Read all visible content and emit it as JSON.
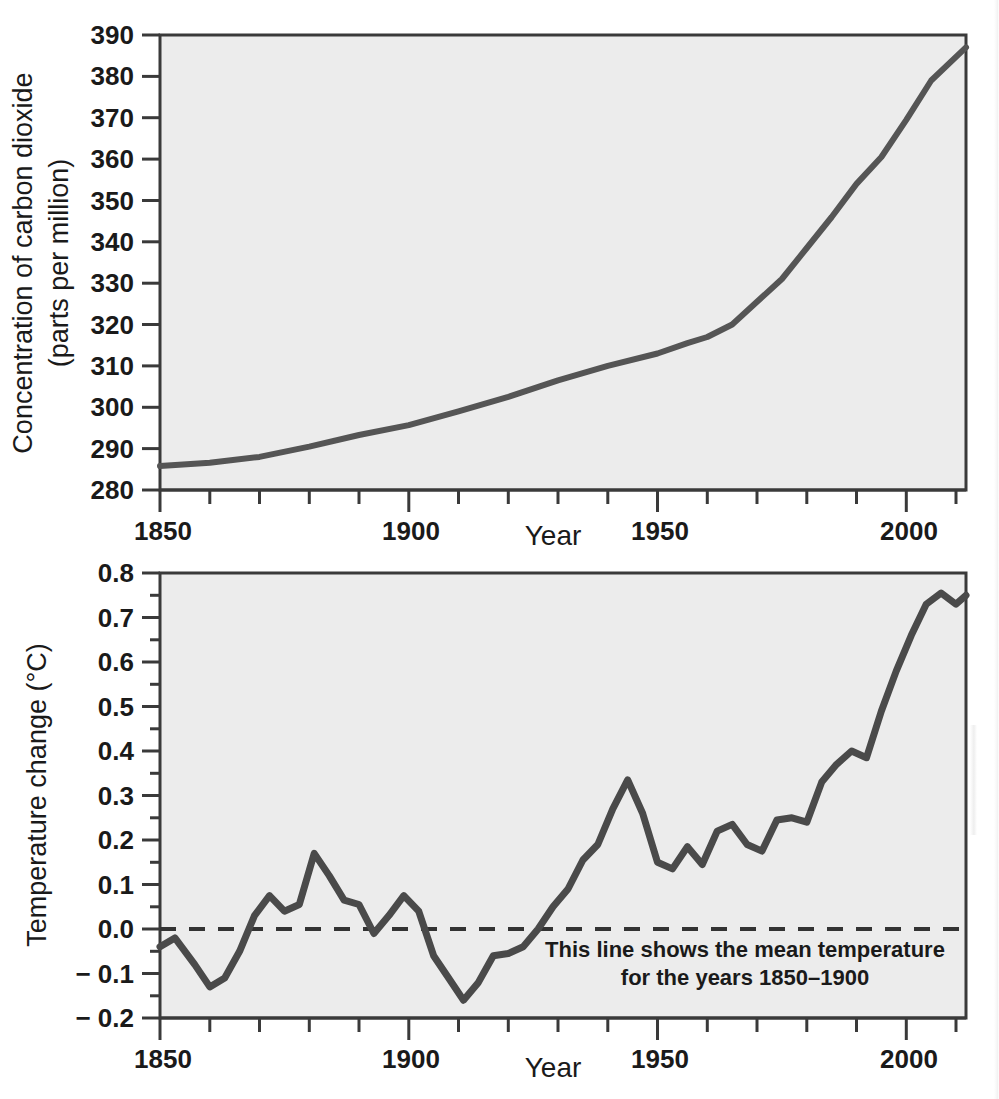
{
  "figure": {
    "background_color": "#ffffff",
    "plot_background_color": "#ececec",
    "line_color": "#4a4a4a",
    "axis_color": "#333333",
    "text_color": "#1a1a1a"
  },
  "charts": [
    {
      "id": "co2",
      "name": "carbon-dioxide-concentration-chart",
      "ylabel_line1": "Concentration of carbon dioxide",
      "ylabel_line2": "(parts per million)",
      "xlabel": "Year",
      "ytick_labels": [
        "280",
        "290",
        "300",
        "310",
        "320",
        "330",
        "340",
        "350",
        "360",
        "370",
        "380",
        "390"
      ],
      "xtick_labels": [
        "1850",
        "1900",
        "1950",
        "2000"
      ]
    },
    {
      "id": "temperature",
      "name": "temperature-change-chart",
      "ylabel_line1": "Temperature change (°C)",
      "xlabel": "Year",
      "ytick_labels": [
        "− 0.2",
        "− 0.1",
        "0.0",
        "0.1",
        "0.2",
        "0.3",
        "0.4",
        "0.5",
        "0.6",
        "0.7",
        "0.8"
      ],
      "xtick_labels": [
        "1850",
        "1900",
        "1950",
        "2000"
      ],
      "annotation_line1": "This line shows the mean temperature",
      "annotation_line2": "for the years 1850–1900"
    }
  ],
  "chart_data": [
    {
      "type": "line",
      "title": "",
      "xlabel": "Year",
      "ylabel": "Concentration of carbon dioxide (parts per million)",
      "xlim": [
        1850,
        2012
      ],
      "ylim": [
        280,
        390
      ],
      "xticks": [
        1850,
        1900,
        1950,
        2000
      ],
      "yticks": [
        280,
        290,
        300,
        310,
        320,
        330,
        340,
        350,
        360,
        370,
        380,
        390
      ],
      "x_minor_tick_interval": 10,
      "grid": false,
      "legend": "none",
      "series": [
        {
          "name": "Atmospheric CO2 concentration",
          "x": [
            1850,
            1860,
            1870,
            1880,
            1890,
            1900,
            1910,
            1920,
            1930,
            1940,
            1950,
            1956,
            1960,
            1965,
            1970,
            1975,
            1980,
            1985,
            1990,
            1995,
            2000,
            2005,
            2012
          ],
          "values": [
            285.8,
            286.6,
            288.0,
            290.5,
            293.3,
            295.7,
            299.0,
            302.5,
            306.5,
            310.0,
            313.0,
            315.5,
            317.0,
            320.0,
            325.5,
            331.0,
            338.5,
            346.0,
            354.0,
            360.5,
            369.5,
            379.0,
            387.0
          ]
        }
      ]
    },
    {
      "type": "line",
      "title": "",
      "xlabel": "Year",
      "ylabel": "Temperature change (°C)",
      "xlim": [
        1850,
        2012
      ],
      "ylim": [
        -0.2,
        0.8
      ],
      "xticks": [
        1850,
        1900,
        1950,
        2000
      ],
      "yticks": [
        -0.2,
        -0.1,
        0.0,
        0.1,
        0.2,
        0.3,
        0.4,
        0.5,
        0.6,
        0.7,
        0.8
      ],
      "y_minor_tick_interval": 0.05,
      "x_minor_tick_interval": 10,
      "grid": false,
      "legend": "none",
      "reference_line": {
        "value": 0.0,
        "style": "dashed",
        "label": "This line shows the mean temperature for the years 1850–1900"
      },
      "series": [
        {
          "name": "Global mean temperature change",
          "x": [
            1850,
            1853,
            1857,
            1860,
            1863,
            1866,
            1869,
            1872,
            1875,
            1878,
            1881,
            1884,
            1887,
            1890,
            1893,
            1896,
            1899,
            1902,
            1905,
            1908,
            1911,
            1914,
            1917,
            1920,
            1923,
            1926,
            1929,
            1932,
            1935,
            1938,
            1941,
            1944,
            1947,
            1950,
            1953,
            1956,
            1959,
            1962,
            1965,
            1968,
            1971,
            1974,
            1977,
            1980,
            1983,
            1986,
            1989,
            1992,
            1995,
            1998,
            2001,
            2004,
            2007,
            2010,
            2012
          ],
          "values": [
            -0.04,
            -0.02,
            -0.08,
            -0.13,
            -0.11,
            -0.05,
            0.03,
            0.075,
            0.04,
            0.055,
            0.17,
            0.12,
            0.065,
            0.055,
            -0.01,
            0.03,
            0.075,
            0.04,
            -0.06,
            -0.11,
            -0.16,
            -0.12,
            -0.06,
            -0.055,
            -0.04,
            0.0,
            0.05,
            0.09,
            0.155,
            0.19,
            0.27,
            0.335,
            0.26,
            0.15,
            0.135,
            0.185,
            0.145,
            0.22,
            0.235,
            0.19,
            0.175,
            0.245,
            0.25,
            0.24,
            0.33,
            0.37,
            0.4,
            0.385,
            0.49,
            0.58,
            0.66,
            0.73,
            0.755,
            0.73,
            0.75
          ]
        }
      ]
    }
  ]
}
